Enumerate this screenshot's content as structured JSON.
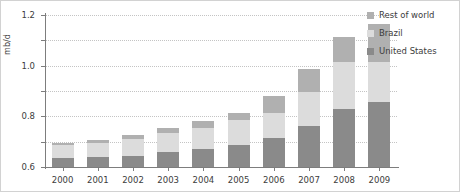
{
  "chart_data": {
    "type": "bar",
    "stacked": true,
    "title": "",
    "xlabel": "",
    "ylabel": "mb/d",
    "ylim": [
      0,
      1.2
    ],
    "yticks": [
      0,
      0.2,
      0.4,
      0.6,
      0.8,
      1.0,
      1.2
    ],
    "ytick_labels": [
      "0",
      "0.2",
      "0.4",
      "0.6",
      "0.8",
      "1.0",
      "1.2"
    ],
    "grid": true,
    "legend_position": "top-right",
    "categories": [
      "2000",
      "2001",
      "2002",
      "2003",
      "2004",
      "2005",
      "2006",
      "2007",
      "2008",
      "2009"
    ],
    "series": [
      {
        "name": "United States",
        "color": "#8a8a8a",
        "values": [
          0.07,
          0.08,
          0.09,
          0.12,
          0.14,
          0.17,
          0.23,
          0.32,
          0.46,
          0.51
        ]
      },
      {
        "name": "Brazil",
        "color": "#dcdcdc",
        "values": [
          0.1,
          0.11,
          0.13,
          0.15,
          0.17,
          0.2,
          0.2,
          0.27,
          0.37,
          0.32
        ]
      },
      {
        "name": "Rest of world",
        "color": "#b0b0b0",
        "values": [
          0.02,
          0.02,
          0.03,
          0.04,
          0.05,
          0.06,
          0.13,
          0.18,
          0.2,
          0.3
        ]
      }
    ],
    "totals": [
      0.19,
      0.21,
      0.25,
      0.31,
      0.36,
      0.43,
      0.56,
      0.77,
      1.03,
      1.13
    ]
  },
  "legend": {
    "entries": [
      {
        "label": "Rest of world",
        "color": "#b0b0b0"
      },
      {
        "label": "Brazil",
        "color": "#dcdcdc"
      },
      {
        "label": "United States",
        "color": "#8a8a8a"
      }
    ]
  },
  "axes": {
    "y_title": "mb/d"
  }
}
